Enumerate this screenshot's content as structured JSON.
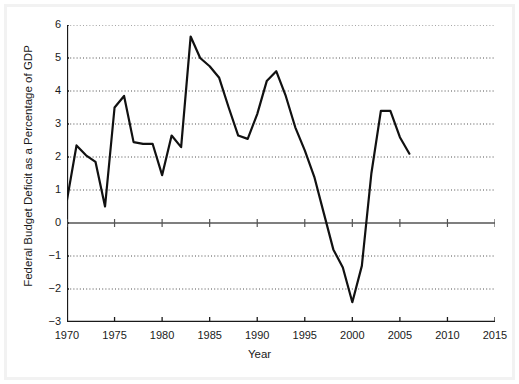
{
  "chart_data": {
    "type": "line",
    "title": "",
    "xlabel": "Year",
    "ylabel": "Federal Budget Deficit as a Percentage of GDP",
    "xlim": [
      1970,
      2015
    ],
    "ylim": [
      -3,
      6
    ],
    "xticks": [
      1970,
      1975,
      1980,
      1985,
      1990,
      1995,
      2000,
      2005,
      2010,
      2015
    ],
    "yticks": [
      -3,
      -2,
      -1,
      0,
      1,
      2,
      3,
      4,
      5,
      6
    ],
    "grid": "horizontal-dotted",
    "legend": "none",
    "zero_line": 0,
    "series": [
      {
        "name": "Federal Budget Deficit as a Percentage of GDP",
        "color": "#111111",
        "x": [
          1970,
          1971,
          1972,
          1973,
          1974,
          1975,
          1976,
          1977,
          1978,
          1979,
          1980,
          1981,
          1982,
          1983,
          1984,
          1985,
          1986,
          1987,
          1988,
          1989,
          1990,
          1991,
          1992,
          1993,
          1994,
          1995,
          1996,
          1997,
          1998,
          1999,
          2000,
          2001,
          2002,
          2003,
          2004,
          2005,
          2006
        ],
        "y": [
          0.7,
          2.35,
          2.05,
          1.85,
          0.5,
          3.5,
          3.85,
          2.45,
          2.4,
          2.4,
          1.45,
          2.65,
          2.3,
          5.65,
          5.0,
          4.75,
          4.4,
          3.5,
          2.65,
          2.55,
          3.3,
          4.3,
          4.6,
          3.85,
          2.9,
          2.2,
          1.4,
          0.3,
          -0.8,
          -1.35,
          -2.4,
          -1.3,
          1.5,
          3.4,
          3.4,
          2.6,
          2.1
        ]
      }
    ]
  },
  "axis": {
    "x_tick_labels": [
      "1970",
      "1975",
      "1980",
      "1985",
      "1990",
      "1995",
      "2000",
      "2005",
      "2010",
      "2015"
    ],
    "y_tick_labels": [
      "6",
      "5",
      "4",
      "3",
      "2",
      "1",
      "0",
      "-1",
      "-2",
      "-3"
    ]
  },
  "colors": {
    "line": "#111111",
    "axis": "#1a1a1a",
    "grid": "#3a3a3a",
    "zero_line": "#555555",
    "background": "#ffffff",
    "frame": "#f2f2f2"
  }
}
